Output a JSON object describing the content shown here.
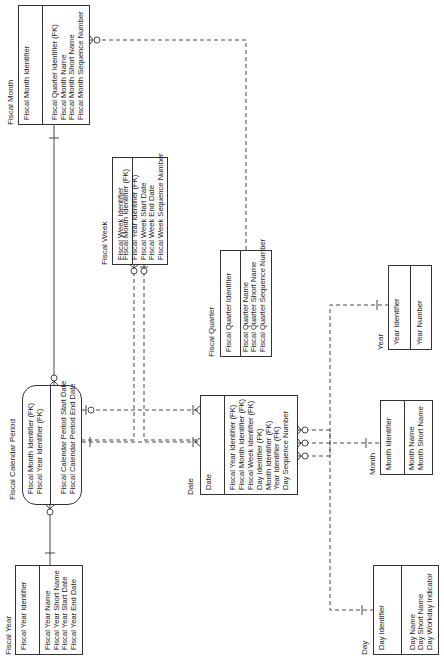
{
  "diagram": {
    "type": "entity-relationship",
    "orientation": "rotated-90-ccw",
    "entities": [
      {
        "id": "fiscal_year",
        "name": "Fiscal Year",
        "keys": [
          "Fiscal Year Identifier"
        ],
        "attributes": [
          "Fiscal Year Name",
          "Fiscal Year Short Name",
          "Fiscal Year Start Date",
          "Fiscal Year End Date"
        ]
      },
      {
        "id": "fiscal_calendar_period",
        "name": "Fiscal Calendar Period",
        "keys": [
          "Fiscal Month Identifier (FK)",
          "Fiscal Year Identifier (FK)"
        ],
        "attributes": [
          "Fiscal Calendar Period Start Date",
          "Fiscal Calendar Period End Date"
        ]
      },
      {
        "id": "fiscal_month",
        "name": "Fiscal Month",
        "keys": [
          "Fiscal Month Identifier"
        ],
        "attributes": [
          "Fiscal Quarter Identifier (FK)",
          "Fiscal Month Name",
          "Fiscal Month Short Name",
          "Fiscal Month Sequence Number"
        ]
      },
      {
        "id": "fiscal_week",
        "name": "Fiscal Week",
        "keys": [
          "Fiscal Week Identifier"
        ],
        "attributes": [
          "Fiscal Month Identifier (FK)",
          "Fiscal Year Identifier (FK)",
          "Fiscal Week Start Date",
          "Fiscal Week End Date",
          "Fiscal Week Sequence Number"
        ]
      },
      {
        "id": "fiscal_quarter",
        "name": "Fiscal Quarter",
        "keys": [
          "Fiscal Quarter Identifier"
        ],
        "attributes": [
          "Fiscal Quarter Name",
          "Fiscal Quarter Short Name",
          "Fiscal Quarter Sequence Number"
        ]
      },
      {
        "id": "date",
        "name": "Date",
        "keys": [
          "Date"
        ],
        "attributes": [
          "Fiscal Year Identifier (FK)",
          "Fiscal Month Identifier (FK)",
          "Fiscal Week Identifier (FK)",
          "Day Identifier (FK)",
          "Month Identifier (FK)",
          "Year Identifier (FK)",
          "Day Sequence Number"
        ]
      },
      {
        "id": "day",
        "name": "Day",
        "keys": [
          "Day Identifier"
        ],
        "attributes": [
          "Day Name",
          "Day Short Name",
          "Day Workday Indicator"
        ]
      },
      {
        "id": "month",
        "name": "Month",
        "keys": [
          "Month Identifier"
        ],
        "attributes": [
          "Month Name",
          "Month Short Name"
        ]
      },
      {
        "id": "year",
        "name": "Year",
        "keys": [
          "Year Identifier"
        ],
        "attributes": [
          "Year Number"
        ]
      }
    ],
    "relationships": [
      {
        "from": "fiscal_year",
        "to": "fiscal_calendar_period",
        "style": "solid",
        "cardinality": "one-to-zero-or-many"
      },
      {
        "from": "fiscal_month",
        "to": "fiscal_calendar_period",
        "style": "solid",
        "cardinality": "one-to-zero-or-many"
      },
      {
        "from": "fiscal_quarter",
        "to": "fiscal_month",
        "style": "dashed",
        "cardinality": "one-to-zero-or-many"
      },
      {
        "from": "fiscal_month",
        "to": "fiscal_week",
        "style": "dashed",
        "cardinality": "one-to-zero-or-many"
      },
      {
        "from": "fiscal_year",
        "to": "fiscal_week",
        "style": "dashed",
        "cardinality": "one-to-zero-or-many"
      },
      {
        "from": "fiscal_calendar_period",
        "to": "date",
        "style": "dashed",
        "cardinality": "one-to-many"
      },
      {
        "from": "fiscal_week",
        "to": "date",
        "style": "dashed",
        "cardinality": "one-to-many"
      },
      {
        "from": "day",
        "to": "date",
        "style": "dashed",
        "cardinality": "one-to-zero-or-many"
      },
      {
        "from": "month",
        "to": "date",
        "style": "dashed",
        "cardinality": "one-to-zero-or-many"
      },
      {
        "from": "year",
        "to": "date",
        "style": "dashed",
        "cardinality": "one-to-zero-or-many"
      }
    ]
  },
  "fiscal_year": {
    "title": "Fiscal Year",
    "keys": [
      "Fiscal Year Identifier"
    ],
    "attrs": [
      "Fiscal Year Name",
      "Fiscal Year Short Name",
      "Fiscal Year Start Date",
      "Fiscal Year End Date"
    ]
  },
  "fiscal_calendar_period": {
    "title": "Fiscal Calendar Period",
    "keys": [
      "Fiscal Month Identifier (FK)",
      "Fiscal Year Identifier (FK)"
    ],
    "attrs": [
      "Fiscal Calendar Period Start Date",
      "Fiscal Calendar Period End Date"
    ]
  },
  "fiscal_month": {
    "title": "Fiscal Month",
    "keys": [
      "Fiscal Month Identifier"
    ],
    "attrs": [
      "Fiscal Quarter Identifier (FK)",
      "Fiscal Month Name",
      "Fiscal Month Short Name",
      "Fiscal Month Sequence Number"
    ]
  },
  "fiscal_week": {
    "title": "Fiscal Week",
    "keys": [
      "Fiscal Week Identifier"
    ],
    "attrs": [
      "Fiscal Month Identifier (FK)",
      "Fiscal Year Identifier (FK)",
      "Fiscal Week Start Date",
      "Fiscal Week End Date",
      "Fiscal Week Sequence Number"
    ]
  },
  "fiscal_quarter": {
    "title": "Fiscal Quarter",
    "keys": [
      "Fiscal Quarter Identifier"
    ],
    "attrs": [
      "Fiscal Quarter Name",
      "Fiscal Quarter Short Name",
      "Fiscal Quarter Sequence Number"
    ]
  },
  "date": {
    "title": "Date",
    "keys": [
      "Date"
    ],
    "attrs": [
      "Fiscal Year Identifier (FK)",
      "Fiscal Month Identifier (FK)",
      "Fiscal Week Identifier (FK)",
      "Day Identifier (FK)",
      "Month Identifier (FK)",
      "Year Identifier (FK)",
      "Day Sequence Number"
    ]
  },
  "day": {
    "title": "Day",
    "keys": [
      "Day Identifier"
    ],
    "attrs": [
      "Day Name",
      "Day Short Name",
      "Day Workday Indicator"
    ]
  },
  "month": {
    "title": "Month",
    "keys": [
      "Month Identifier"
    ],
    "attrs": [
      "Month Name",
      "Month Short Name"
    ]
  },
  "year": {
    "title": "Year",
    "keys": [
      "Year Identifier"
    ],
    "attrs": [
      "Year Number"
    ]
  },
  "colors": {
    "line": "#333333",
    "background": "#ffffff",
    "text": "#222222"
  }
}
